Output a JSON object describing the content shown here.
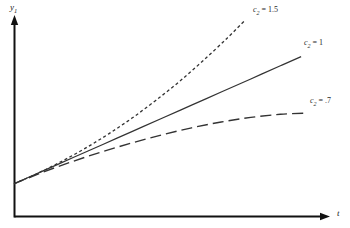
{
  "figure": {
    "background_color": "#ffffff",
    "ink_color": "#333333",
    "axis_color": "#111111"
  },
  "axes": {
    "y_axis": {
      "label_var": "y",
      "label_sub": "1",
      "name": "y-axis"
    },
    "x_axis": {
      "label_var": "t",
      "label_sub": "",
      "name": "t-axis"
    }
  },
  "chart_data": {
    "type": "line",
    "title": "",
    "xlabel": "t",
    "ylabel": "y1",
    "grid": false,
    "legend_position": "inline-right-of-each-curve",
    "xlim": [
      0,
      1
    ],
    "ylim": [
      0,
      1
    ],
    "axis_ticks": {
      "x": [],
      "y": []
    },
    "common_origin": {
      "x": 0.0,
      "y": 0.155
    },
    "series": [
      {
        "name": "c2 = 1.5",
        "param": "c2",
        "value": 1.5,
        "linestyle": "dotted",
        "color": "#333333",
        "label_var": "c",
        "label_sub": "2",
        "label_value": "1.5",
        "label_text": "c2 = 1.5",
        "shape": "convex-accelerating",
        "x": [
          0.0,
          0.08,
          0.16,
          0.24,
          0.32,
          0.4,
          0.48,
          0.56,
          0.64,
          0.72,
          0.78
        ],
        "y": [
          0.155,
          0.205,
          0.262,
          0.325,
          0.395,
          0.472,
          0.557,
          0.648,
          0.748,
          0.855,
          0.94
        ]
      },
      {
        "name": "c2 = 1",
        "param": "c2",
        "value": 1,
        "linestyle": "solid",
        "color": "#333333",
        "label_var": "c",
        "label_sub": "2",
        "label_value": "1",
        "label_text": "c2 = 1",
        "shape": "linear",
        "x": [
          0.0,
          0.1,
          0.2,
          0.3,
          0.4,
          0.5,
          0.6,
          0.7,
          0.8,
          0.9,
          0.97
        ],
        "y": [
          0.155,
          0.218,
          0.281,
          0.344,
          0.407,
          0.47,
          0.533,
          0.596,
          0.659,
          0.722,
          0.766
        ]
      },
      {
        "name": "c2 = .7",
        "param": "c2",
        "value": 0.7,
        "linestyle": "dashed",
        "color": "#333333",
        "label_var": "c",
        "label_sub": "2",
        "label_value": ".7",
        "label_text": "c2 = .7",
        "shape": "concave-saturating",
        "x": [
          0.0,
          0.1,
          0.2,
          0.3,
          0.4,
          0.5,
          0.6,
          0.7,
          0.8,
          0.9,
          0.99
        ],
        "y": [
          0.155,
          0.212,
          0.263,
          0.31,
          0.352,
          0.39,
          0.424,
          0.452,
          0.474,
          0.489,
          0.495
        ]
      }
    ]
  }
}
